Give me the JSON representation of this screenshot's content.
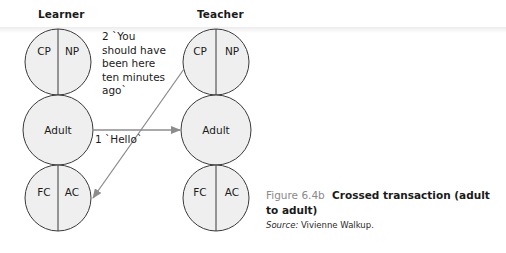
{
  "diagram": {
    "left_column": {
      "title": "Learner",
      "ego_states": [
        {
          "type": "split",
          "left": "CP",
          "right": "NP"
        },
        {
          "type": "single",
          "label": "Adult"
        },
        {
          "type": "split",
          "left": "FC",
          "right": "AC"
        }
      ]
    },
    "right_column": {
      "title": "Teacher",
      "ego_states": [
        {
          "type": "split",
          "left": "CP",
          "right": "NP"
        },
        {
          "type": "single",
          "label": "Adult"
        },
        {
          "type": "split",
          "left": "FC",
          "right": "AC"
        }
      ]
    },
    "transactions": [
      {
        "number": "1",
        "text": "1 `Hello`",
        "from": "Learner Adult",
        "to": "Teacher Adult"
      },
      {
        "number": "2",
        "text_lines": [
          "2 `You",
          "should have",
          "been here",
          "ten minutes",
          "ago`"
        ],
        "from": "Teacher CP",
        "to": "Learner AC"
      }
    ],
    "colors": {
      "circle_fill": "#efefef",
      "circle_stroke": "#3a3a3a",
      "arrow": "#8c8c8c",
      "figure_number": "#8a8a8a"
    }
  },
  "caption": {
    "figure_number": "Figure 6.4b",
    "title": "Crossed transaction (adult to adult)",
    "source_label": "Source:",
    "source_text": " Vivienne Walkup."
  }
}
